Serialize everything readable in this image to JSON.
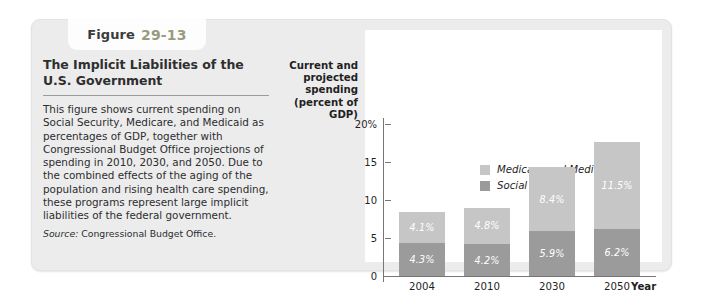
{
  "figure": {
    "label_word": "Figure",
    "number": "29-13",
    "title": "The Implicit Liabilities of the U.S. Government",
    "body": "This figure shows current spending on Social Security, Medicare, and Medicaid as percentages of GDP, together with Congressional Budget Office projections of spending in 2010, 2030, and 2050. Due to the combined effects of the aging of the population and rising health care spending, these programs represent large implicit liabilities of the federal government.",
    "source_label": "Source:",
    "source_text": "Congressional Budget Office."
  },
  "chart_data": {
    "type": "bar",
    "stacked": true,
    "title": "",
    "xlabel": "Year",
    "ylabel": "Current and projected spending (percent of GDP)",
    "categories": [
      "2004",
      "2010",
      "2030",
      "2050"
    ],
    "ylim": [
      0,
      20
    ],
    "yticks": [
      "0",
      "5",
      "10",
      "15",
      "20%"
    ],
    "ytick_values": [
      0,
      5,
      10,
      15,
      20
    ],
    "grid": false,
    "legend_position": "top-center",
    "series": [
      {
        "name": "Social Security",
        "color": "#9b9b9b",
        "values": [
          4.3,
          4.2,
          5.9,
          6.2
        ],
        "labels": [
          "4.3%",
          "4.2%",
          "5.9%",
          "6.2%"
        ]
      },
      {
        "name": "Medicare and Medicaid",
        "color": "#c6c6c6",
        "values": [
          4.1,
          4.8,
          8.4,
          11.5
        ],
        "labels": [
          "4.1%",
          "4.8%",
          "8.4%",
          "11.5%"
        ]
      }
    ],
    "totals": [
      8.4,
      9.0,
      14.3,
      17.7
    ]
  },
  "colors": {
    "card_background": "#ececed",
    "plot_background": "#ffffff",
    "axis": "#767676",
    "figure_number": "#9a9b7e",
    "medicare_medicaid": "#c6c6c6",
    "social_security": "#9b9b9b"
  }
}
